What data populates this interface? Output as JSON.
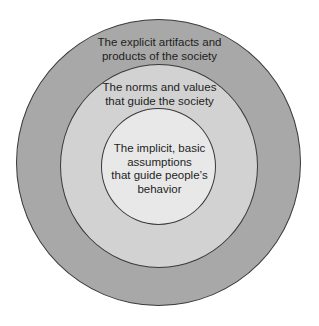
{
  "diagram": {
    "type": "concentric-circles",
    "colors": {
      "outer_fill": "#a8a8a8",
      "middle_fill": "#d2d2d2",
      "inner_fill": "#e8e8e8",
      "stroke": "#3a3a3a",
      "text": "#1e1e1e",
      "background": "#ffffff"
    },
    "layers": [
      {
        "name": "outer",
        "lines": [
          "The explicit artifacts and",
          "products of the society"
        ]
      },
      {
        "name": "middle",
        "lines": [
          "The norms and values",
          "that guide the society"
        ]
      },
      {
        "name": "inner",
        "lines": [
          "The implicit, basic",
          "assumptions",
          "that guide people’s",
          "behavior"
        ]
      }
    ]
  }
}
